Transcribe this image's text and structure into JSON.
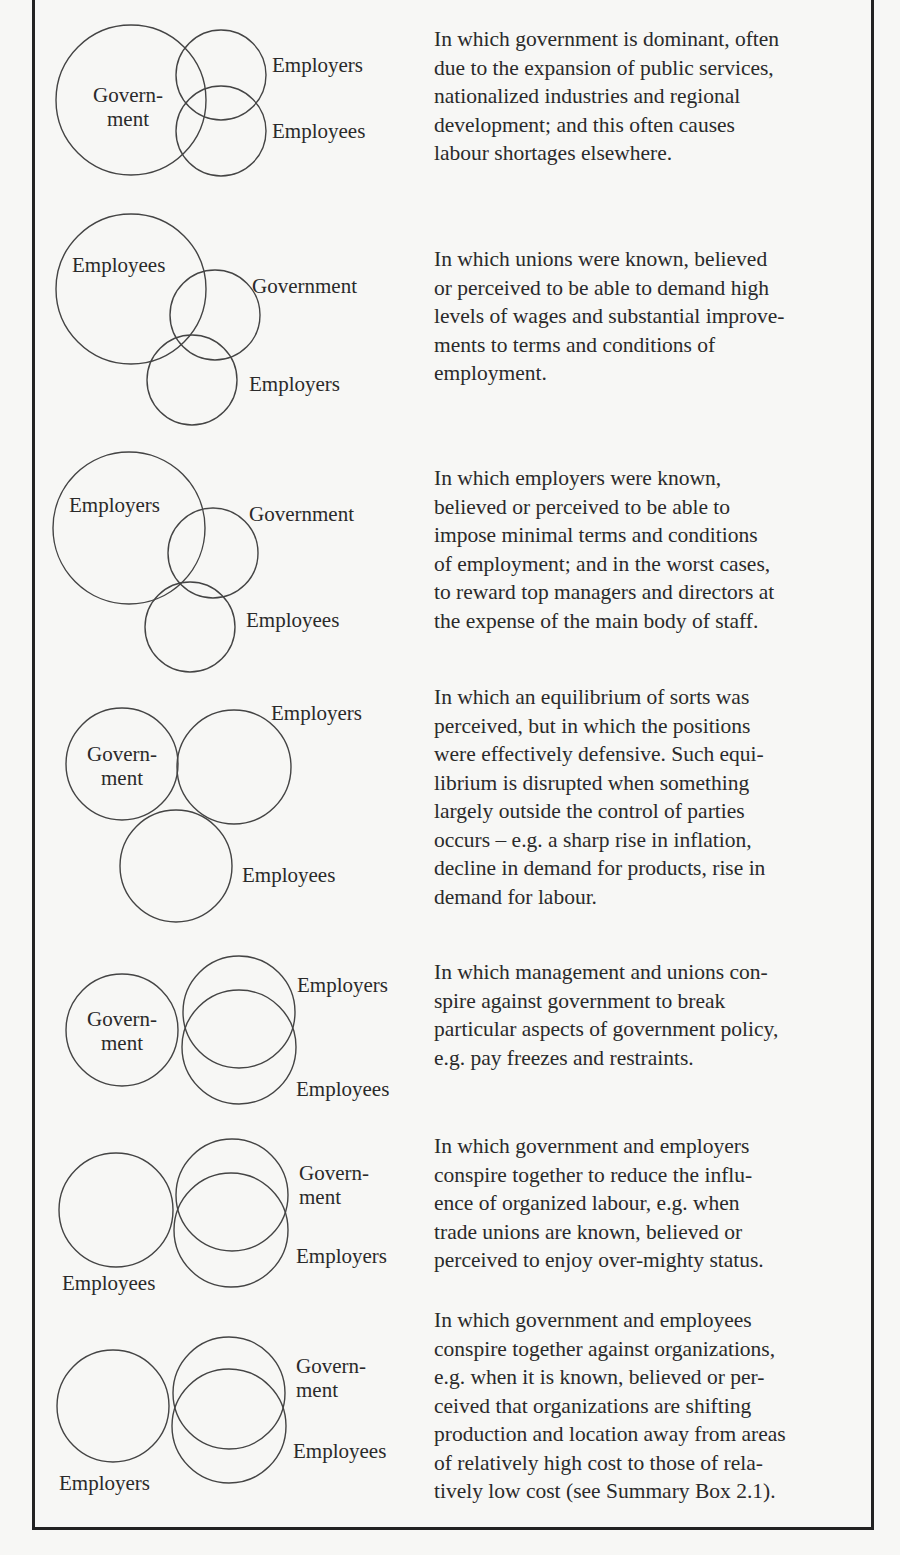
{
  "rows": [
    {
      "labels": {
        "a": "Govern-",
        "a2": "ment",
        "b": "Employers",
        "c": "Employees"
      },
      "description": "In which government is dominant, often\ndue to the expansion of public services,\nnationalized industries and regional\ndevelopment; and this often causes\nlabour shortages elsewhere."
    },
    {
      "labels": {
        "a": "Employees",
        "b": "Government",
        "c": "Employers"
      },
      "description": "In which unions were known, believed\nor perceived to be able to demand high\nlevels of wages and substantial improve-\nments to terms and conditions of\nemployment."
    },
    {
      "labels": {
        "a": "Employers",
        "b": "Government",
        "c": "Employees"
      },
      "description": "In which employers were known,\nbelieved or perceived to be able to\nimpose minimal terms and conditions\nof employment; and in the worst cases,\nto reward top managers and directors at\nthe expense of the main body of staff."
    },
    {
      "labels": {
        "a": "Govern-",
        "a2": "ment",
        "b": "Employers",
        "c": "Employees"
      },
      "description": "In which an equilibrium of sorts was\nperceived, but in which the positions\nwere effectively defensive. Such equi-\nlibrium is disrupted when something\nlargely outside the control of parties\noccurs – e.g. a sharp rise in inflation,\ndecline in demand for products, rise in\ndemand for labour."
    },
    {
      "labels": {
        "a": "Govern-",
        "a2": "ment",
        "b": "Employers",
        "c": "Employees"
      },
      "description": "In which management and unions con-\nspire against government to break\nparticular aspects of government policy,\ne.g. pay freezes and restraints."
    },
    {
      "labels": {
        "a": "Employees",
        "b": "Govern-",
        "b2": "ment",
        "c": "Employers"
      },
      "description": "In which government and employers\nconspire together to reduce the influ-\nence of organized labour, e.g. when\ntrade unions are known, believed or\nperceived to enjoy over-mighty status."
    },
    {
      "labels": {
        "a": "Employers",
        "b": "Govern-",
        "b2": "ment",
        "c": "Employees"
      },
      "description": "In which government and employees\nconspire together against organizations,\ne.g. when it is known, believed or per-\nceived that organizations are shifting\nproduction and location away from areas\nof relatively high cost to those of rela-\ntively low cost (see Summary Box 2.1)."
    }
  ]
}
